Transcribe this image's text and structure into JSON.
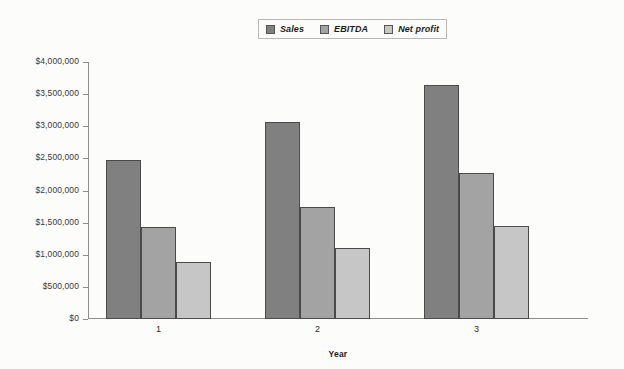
{
  "chart_data": {
    "type": "bar",
    "title": "",
    "xlabel": "Year",
    "ylabel": "",
    "categories": [
      "1",
      "2",
      "3"
    ],
    "series": [
      {
        "name": "Sales",
        "color": "#808080",
        "values": [
          2470000,
          3060000,
          3650000
        ]
      },
      {
        "name": "EBITDA",
        "color": "#a3a3a3",
        "values": [
          1430000,
          1750000,
          2270000
        ]
      },
      {
        "name": "Net profit",
        "color": "#c6c6c6",
        "values": [
          890000,
          1100000,
          1440000
        ]
      }
    ],
    "ylim": [
      0,
      4000000
    ],
    "ytick_values": [
      0,
      500000,
      1000000,
      1500000,
      2000000,
      2500000,
      3000000,
      3500000,
      4000000
    ],
    "ytick_labels": [
      "$0",
      "$500,000",
      "$1,000,000",
      "$1,500,000",
      "$2,000,000",
      "$2,500,000",
      "$3,000,000",
      "$3,500,000",
      "$4,000,000"
    ],
    "grid": false,
    "legend_position": "top-center"
  },
  "legend": {
    "entries": [
      {
        "label": "Sales"
      },
      {
        "label": "EBITDA"
      },
      {
        "label": "Net profit"
      }
    ]
  },
  "axes": {
    "x_title": "Year"
  }
}
